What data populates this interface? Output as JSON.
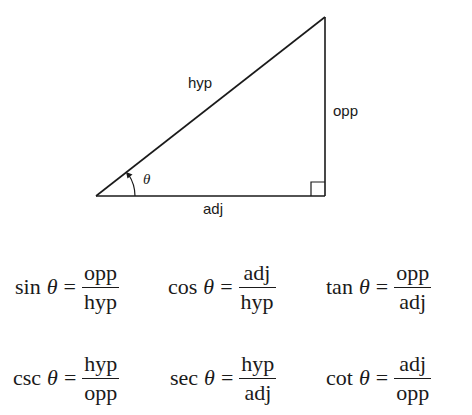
{
  "diagram": {
    "type": "right-triangle",
    "stroke_color": "#1a1a1a",
    "vertices": {
      "angle_vertex": [
        96,
        196
      ],
      "top_vertex": [
        325,
        17
      ],
      "right_angle_vertex": [
        325,
        196
      ]
    },
    "labels": {
      "hypotenuse": "hyp",
      "opposite": "opp",
      "adjacent": "adj",
      "angle": "θ"
    },
    "right_angle_marker": true,
    "angle_arc_with_arrow": true
  },
  "formulas": [
    {
      "fn": "sin",
      "var": "θ",
      "eq": "=",
      "num": "opp",
      "den": "hyp"
    },
    {
      "fn": "cos",
      "var": "θ",
      "eq": "=",
      "num": "adj",
      "den": "hyp"
    },
    {
      "fn": "tan",
      "var": "θ",
      "eq": "=",
      "num": "opp",
      "den": "adj"
    },
    {
      "fn": "csc",
      "var": "θ",
      "eq": "=",
      "num": "hyp",
      "den": "opp"
    },
    {
      "fn": "sec",
      "var": "θ",
      "eq": "=",
      "num": "hyp",
      "den": "adj"
    },
    {
      "fn": "cot",
      "var": "θ",
      "eq": "=",
      "num": "adj",
      "den": "opp"
    }
  ]
}
